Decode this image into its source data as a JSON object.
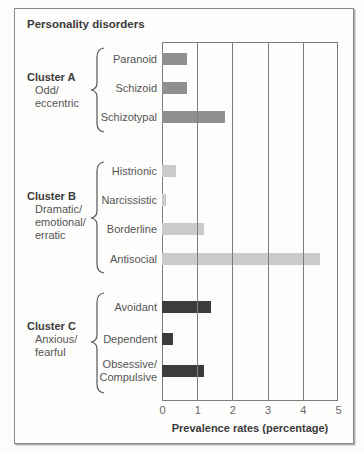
{
  "chart_data": {
    "type": "bar",
    "orientation": "horizontal",
    "title": "Personality disorders",
    "xlabel": "Prevalence rates (percentage)",
    "ylabel": "",
    "xlim": [
      0,
      5
    ],
    "xticks": [
      "0",
      "1",
      "2",
      "3",
      "4",
      "5"
    ],
    "grid": true,
    "legend": null,
    "categories": [
      "Paranoid",
      "Schizoid",
      "Schizotypal",
      "Histrionic",
      "Narcissistic",
      "Borderline",
      "Antisocial",
      "Avoidant",
      "Dependent",
      "Obsessive/ Compulsive"
    ],
    "values": [
      0.7,
      0.7,
      1.8,
      0.4,
      0.1,
      1.2,
      4.5,
      1.4,
      0.3,
      1.2
    ],
    "groups": [
      {
        "name": "Cluster A",
        "description_lines": [
          "Odd/",
          "eccentric"
        ],
        "categories": [
          "Paranoid",
          "Schizoid",
          "Schizotypal"
        ],
        "values": [
          0.7,
          0.7,
          1.8
        ],
        "color": "#8f8f8f"
      },
      {
        "name": "Cluster B",
        "description_lines": [
          "Dramatic/",
          "emotional/",
          "erratic"
        ],
        "categories": [
          "Histrionic",
          "Narcissistic",
          "Borderline",
          "Antisocial"
        ],
        "values": [
          0.4,
          0.1,
          1.2,
          4.5
        ],
        "color": "#cacaca"
      },
      {
        "name": "Cluster C",
        "description_lines": [
          "Anxious/",
          "fearful"
        ],
        "categories": [
          "Avoidant",
          "Dependent",
          "Obsessive/ Compulsive"
        ],
        "values": [
          1.4,
          0.3,
          1.2
        ],
        "color": "#3c3c3c"
      }
    ]
  },
  "bar_group_index": [
    0,
    0,
    0,
    1,
    1,
    1,
    1,
    2,
    2,
    2
  ]
}
